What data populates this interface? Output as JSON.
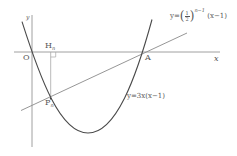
{
  "diagram": {
    "type": "coordinate-plane-graph",
    "axes": {
      "x_label": "x",
      "y_label": "y"
    },
    "points": {
      "origin": {
        "label": "O"
      },
      "A": {
        "label": "A"
      },
      "H": {
        "label": "H",
        "subscript": "n"
      },
      "P": {
        "label": "P",
        "subscript": "n"
      }
    },
    "curves": {
      "parabola": {
        "label": "y=3x(x−1)"
      },
      "line": {
        "label_prefix": "y=",
        "fraction_num": "1",
        "fraction_den": "2",
        "exponent": "n−1",
        "label_suffix": "(x−1)"
      }
    },
    "colors": {
      "axis": "#9a9a9a",
      "curve": "#555555",
      "line": "#8a8a8a",
      "text": "#555555"
    }
  }
}
